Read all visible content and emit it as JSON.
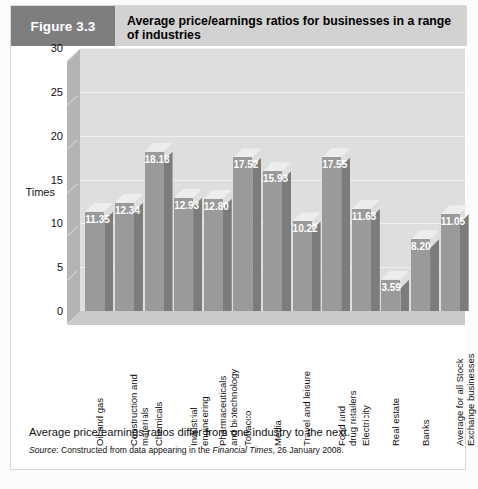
{
  "figure": {
    "number_label": "Figure 3.3",
    "title": "Average price/earnings ratios for businesses in a range of industries",
    "caption": "Average price/earnings ratios differ from one industry to the next.",
    "source_prefix": "Source",
    "source_text": ": Constructed from data appearing in the ",
    "source_publication": "Financial Times",
    "source_suffix": ", 26 January 2008."
  },
  "colors": {
    "figure_number_box": "#7e7e7e",
    "header_band": "#d2d2d2",
    "panel_background": "#ffffff",
    "bar_front": "#9a9a9a",
    "bar_side": "#7c7c7c",
    "bar_top": "#ededed",
    "back_wall": "#dedede",
    "side_wall": "#b4b4b4",
    "floor": "#c9c9c9",
    "value_label": "#ffffff"
  },
  "chart_data": {
    "type": "bar",
    "title": "Average price/earnings ratios for businesses in a range of industries",
    "xlabel": "",
    "ylabel": "Times",
    "ylim": [
      0,
      30
    ],
    "yticks": [
      0,
      5,
      10,
      15,
      20,
      25,
      30
    ],
    "grid": true,
    "legend": "none",
    "three_d": true,
    "categories": [
      "Oil and gas",
      "Construction and\nmaterials",
      "Chemicals",
      "Industrial\nengineering",
      "Pharmaceuticals\nand biotechnology",
      "Tobacco",
      "Media",
      "Travel and leisure",
      "Food and\ndrug retailers",
      "Electricity",
      "Real estate",
      "Banks",
      "Average for all Stock\nExchange businesses"
    ],
    "values": [
      11.35,
      12.34,
      18.18,
      12.93,
      12.8,
      17.52,
      15.93,
      10.22,
      17.55,
      11.63,
      3.59,
      8.2,
      11.05
    ],
    "value_labels": [
      "11.35",
      "12.34",
      "18.18",
      "12.93",
      "12.80",
      "17.52",
      "15.93",
      "10.22",
      "17.55",
      "11.63",
      "3.59",
      "8.20",
      "11.05"
    ]
  }
}
